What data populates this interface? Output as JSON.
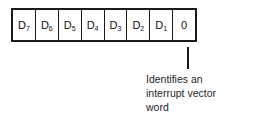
{
  "diagram": {
    "colors": {
      "background": "#ffffff",
      "stroke": "#1a1a1a",
      "text": "#1f1f1f"
    },
    "bitfield": {
      "cells": [
        {
          "base": "D",
          "sub": "7"
        },
        {
          "base": "D",
          "sub": "6"
        },
        {
          "base": "D",
          "sub": "5"
        },
        {
          "base": "D",
          "sub": "4"
        },
        {
          "base": "D",
          "sub": "3"
        },
        {
          "base": "D",
          "sub": "2"
        },
        {
          "base": "D",
          "sub": "1"
        },
        {
          "base": "0",
          "sub": ""
        }
      ]
    },
    "callout": {
      "lines": [
        "Identifies an",
        "interrupt vector",
        "word"
      ]
    }
  }
}
